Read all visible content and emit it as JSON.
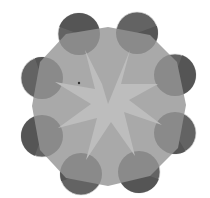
{
  "figure": {
    "width": 210,
    "height": 198,
    "colors": {
      "background": "#ffffff",
      "octagon": "#a9a9a9",
      "star": "#bdbdbd",
      "circle_dark": "#606060",
      "circle_mid": "#747474",
      "circle_light_wedge": "#8c8c8c",
      "circle_rim": "#e8e8e8"
    },
    "octagon_points": "108,27 150,35 177,62 186,105 178,148 150,176 108,186 66,178 40,150 32,106 40,62 66,34",
    "star_points": "108,104 130,50 121,84 158,84 129,100 162,125 124,112 135,156 111,122 86,160 97,118 58,128 91,104 55,82 95,89 85,50 102,84",
    "circles": [
      {
        "name": "top-left",
        "cx": 79,
        "cy": 34,
        "r": 21,
        "angle": 200
      },
      {
        "name": "top-right",
        "cx": 137,
        "cy": 33,
        "r": 21,
        "angle": 340
      },
      {
        "name": "right-upper",
        "cx": 175,
        "cy": 75,
        "r": 21,
        "angle": 290
      },
      {
        "name": "right-lower",
        "cx": 175,
        "cy": 133,
        "r": 21,
        "angle": 60
      },
      {
        "name": "bottom-right",
        "cx": 139,
        "cy": 172,
        "r": 21,
        "angle": 20
      },
      {
        "name": "bottom-left",
        "cx": 81,
        "cy": 174,
        "r": 21,
        "angle": 160
      },
      {
        "name": "left-lower",
        "cx": 42,
        "cy": 136,
        "r": 21,
        "angle": 110
      },
      {
        "name": "left-upper",
        "cx": 42,
        "cy": 78,
        "r": 21,
        "angle": 250
      }
    ],
    "marker": {
      "cx": 79,
      "cy": 83,
      "r": 1.2,
      "color": "#333333"
    }
  }
}
